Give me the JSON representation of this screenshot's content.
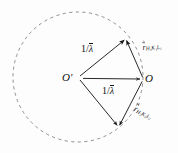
{
  "figure": {
    "type": "ewald-sphere-construction",
    "background_color": "#fdfdfd",
    "stroke_color": "#111111",
    "dash_color": "#8a8a8a",
    "width": 178,
    "height": 153,
    "points": {
      "center_label": "O'",
      "origin_label": "O",
      "center_xy": [
        78,
        78
      ],
      "origin_xy": [
        143,
        79
      ],
      "top_vertex_xy": [
        125,
        39
      ],
      "bottom_vertex_xy": [
        118,
        127
      ]
    },
    "circle": {
      "cx": 78,
      "cy": 77,
      "r": 65,
      "dashed": true
    },
    "lengths": {
      "upper_arm": "1/λ",
      "center_to_origin": "1/λ",
      "upper_arm_numerator": "1",
      "upper_arm_denominator": "λ",
      "center_arm_numerator": "1",
      "center_arm_denominator": "λ"
    },
    "vectors": [
      {
        "name": "r-vector-upper",
        "symbol": "r",
        "subscript": "H₁K₁L₁",
        "subscript_plain": "H1K1L1",
        "label": "r⃗H₁K₁L₁"
      },
      {
        "name": "r-vector-lower",
        "symbol": "r",
        "subscript": "H₂K₂L₂",
        "subscript_plain": "H2K2L2",
        "label": "r⃗H₂K₂L₂"
      }
    ]
  }
}
